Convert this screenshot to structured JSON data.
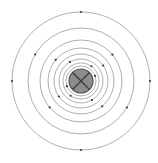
{
  "diagram": {
    "type": "bohr-atom-model",
    "center": [
      81,
      81
    ],
    "nucleus": {
      "radius": 12,
      "fill": "#8c8c8c",
      "stroke": "#555555",
      "cross_color": "#3c3c3c"
    },
    "orbits": [
      {
        "radius": 15,
        "electrons_deg": [
          200,
          20
        ]
      },
      {
        "radius": 18,
        "electrons_deg": [
          235,
          55
        ]
      },
      {
        "radius": 22,
        "electrons_deg": [
          300,
          120
        ]
      },
      {
        "radius": 27,
        "electrons_deg": [
          215,
          35
        ]
      },
      {
        "radius": 33,
        "electrons_deg": [
          310,
          140
        ]
      },
      {
        "radius": 41,
        "electrons_deg": [
          220,
          40
        ]
      },
      {
        "radius": 53,
        "electrons_deg": [
          330,
          150
        ]
      },
      {
        "radius": 69,
        "electrons_deg": [
          90,
          180,
          270,
          0
        ]
      }
    ],
    "orbit_color": "#9a9a9a",
    "electron_color": "#3a3a3a"
  }
}
